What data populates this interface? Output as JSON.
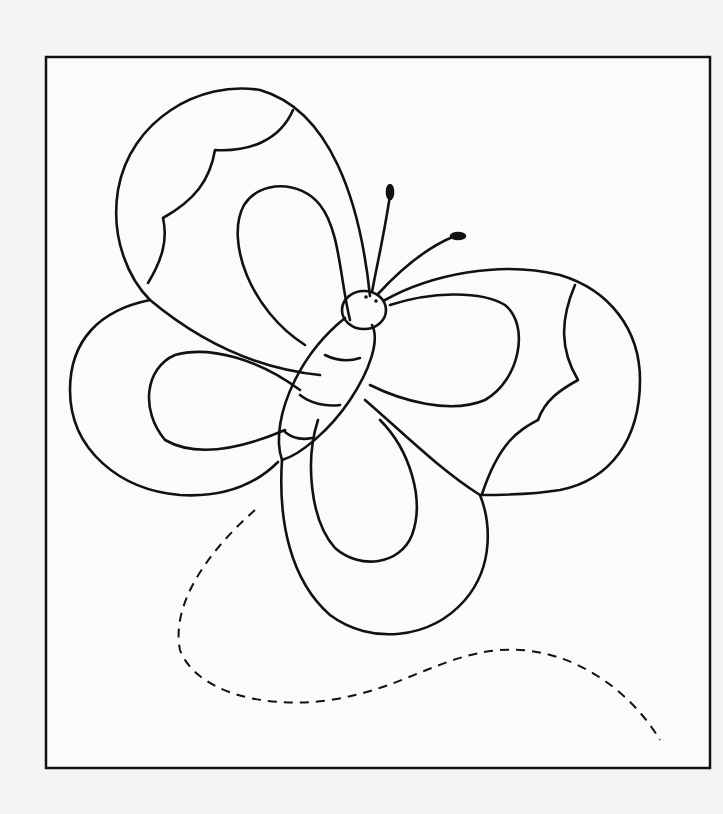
{
  "page": {
    "kind": "coloring-page",
    "background": "#f4f4f2",
    "frame_color": "#111111",
    "line_color": "#111111"
  },
  "elements": {
    "frame": "rectangular-border",
    "butterfly": [
      "upper-left-wing",
      "lower-left-wing",
      "right-wing",
      "lower-right-wing",
      "body",
      "head",
      "antennae"
    ],
    "flight_path": "dashed-trail"
  }
}
